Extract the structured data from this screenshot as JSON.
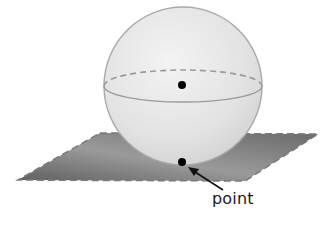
{
  "diagram": {
    "title": "",
    "type": "sphere-tangent-plane",
    "labels": {
      "point": "point"
    },
    "colors": {
      "background": "#ffffff",
      "plane_fill_dark": "#6e6e6e",
      "plane_fill_light": "#b0b0b0",
      "plane_edge": "#7a7a7a",
      "sphere_fill": "#e6e6e6",
      "sphere_edge": "#a9a9a9",
      "equator": "#9a9a9a",
      "point_fill": "#000000",
      "arrow": "#111111"
    },
    "elements": [
      {
        "name": "sphere",
        "description": "sphere resting on plane"
      },
      {
        "name": "equator",
        "description": "great circle; back half dashed, front half solid"
      },
      {
        "name": "center-point",
        "description": "dot at sphere center"
      },
      {
        "name": "plane",
        "description": "parallelogram with dashed edges"
      },
      {
        "name": "tangent-point",
        "description": "dot where sphere touches plane"
      },
      {
        "name": "arrow",
        "description": "arrow from label to tangent point"
      }
    ]
  }
}
